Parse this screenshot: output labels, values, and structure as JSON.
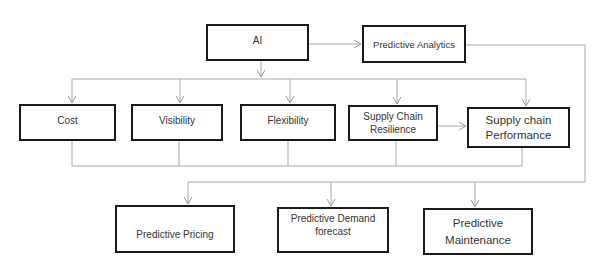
{
  "diagram": {
    "nodes": {
      "ai": {
        "label": "AI"
      },
      "predictive_analytics": {
        "label": "Predictive Analytics"
      },
      "cost": {
        "label": "Cost"
      },
      "visibility": {
        "label": "Visibility"
      },
      "flexibility": {
        "label": "Flexibility"
      },
      "resilience": {
        "label": "Supply Chain\nResilience"
      },
      "performance": {
        "label": "Supply chain\nPerformance"
      },
      "pricing": {
        "label": "Predictive Pricing"
      },
      "demand": {
        "label": "Predictive Demand\nforecast"
      },
      "maintenance": {
        "label": "Predictive\nMaintenance"
      }
    },
    "edges": [
      {
        "from": "AI",
        "to": "Predictive Analytics"
      },
      {
        "from": "AI",
        "to": "Cost"
      },
      {
        "from": "AI",
        "to": "Visibility"
      },
      {
        "from": "AI",
        "to": "Flexibility"
      },
      {
        "from": "AI",
        "to": "Supply Chain Resilience"
      },
      {
        "from": "AI",
        "to": "Supply chain Performance"
      },
      {
        "from": "Supply Chain Resilience",
        "to": "Supply chain Performance"
      },
      {
        "from": "Cost / Visibility / Flexibility / Resilience / Performance",
        "to": "Predictive Pricing"
      },
      {
        "from": "Cost / Visibility / Flexibility / Resilience / Performance",
        "to": "Predictive Demand forecast"
      },
      {
        "from": "Cost / Visibility / Flexibility / Resilience / Performance",
        "to": "Predictive Maintenance"
      },
      {
        "from": "Predictive Analytics",
        "to": "Predictive Pricing / Demand forecast / Maintenance"
      }
    ],
    "colors": {
      "box_border": "#1a1a1a",
      "connector": "#a0a0a0",
      "text": "#333333"
    }
  }
}
